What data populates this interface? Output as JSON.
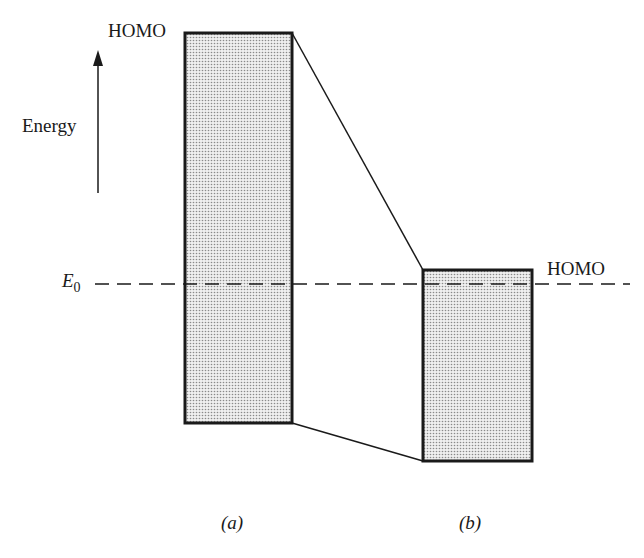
{
  "diagram": {
    "axis_label": "Energy",
    "reference_level": {
      "symbol": "E",
      "subscript": "0"
    },
    "bands": [
      {
        "id": "a",
        "caption": "(a)",
        "top_label": "HOMO",
        "top_label_side": "left"
      },
      {
        "id": "b",
        "caption": "(b)",
        "top_label": "HOMO",
        "top_label_side": "right"
      }
    ],
    "colors": {
      "line": "#1a1a1a",
      "fill": "#d8d8d8",
      "background": "#ffffff"
    }
  }
}
